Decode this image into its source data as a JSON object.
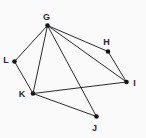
{
  "diagram": {
    "type": "graph",
    "width": 146,
    "height": 138,
    "background": "#fafafa",
    "edge_color": "#2b2b2b",
    "edge_width": 1,
    "node_color": "#141414",
    "node_radius": 2.3,
    "label_color": "#2a2a2a",
    "label_font_size": 9,
    "nodes": [
      {
        "id": "G",
        "label": "G",
        "x": 47.5,
        "y": 25.5,
        "label_x": 46.5,
        "label_y": 20
      },
      {
        "id": "H",
        "label": "H",
        "x": 108,
        "y": 51.5,
        "label_x": 106.5,
        "label_y": 45
      },
      {
        "id": "L",
        "label": "L",
        "x": 14.5,
        "y": 61.5,
        "label_x": 6,
        "label_y": 63
      },
      {
        "id": "I",
        "label": "I",
        "x": 126.5,
        "y": 82,
        "label_x": 134.5,
        "label_y": 85.5
      },
      {
        "id": "K",
        "label": "K",
        "x": 33,
        "y": 93.5,
        "label_x": 22,
        "label_y": 97
      },
      {
        "id": "J",
        "label": "J",
        "x": 96.5,
        "y": 116.5,
        "label_x": 94.5,
        "label_y": 130.5
      }
    ],
    "edges": [
      [
        "G",
        "L"
      ],
      [
        "G",
        "K"
      ],
      [
        "G",
        "H"
      ],
      [
        "G",
        "I"
      ],
      [
        "G",
        "J"
      ],
      [
        "L",
        "K"
      ],
      [
        "H",
        "I"
      ],
      [
        "K",
        "I"
      ],
      [
        "K",
        "J"
      ]
    ]
  }
}
